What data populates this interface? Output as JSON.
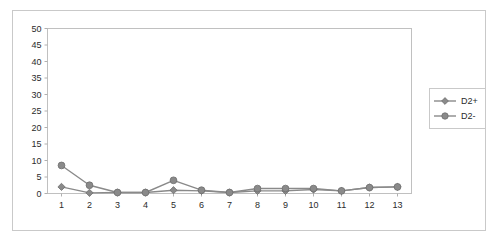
{
  "chart_data": {
    "type": "line",
    "title": "",
    "xlabel": "",
    "ylabel": "",
    "categories": [
      "1",
      "2",
      "3",
      "4",
      "5",
      "6",
      "7",
      "8",
      "9",
      "10",
      "11",
      "12",
      "13"
    ],
    "ylim": [
      0,
      50
    ],
    "yticks": [
      0,
      5,
      10,
      15,
      20,
      25,
      30,
      35,
      40,
      45,
      50
    ],
    "ytick_labels": [
      "0",
      "5",
      "10",
      "15",
      "20",
      "25",
      "30",
      "35",
      "40",
      "45",
      "50"
    ],
    "grid": false,
    "legend_position": "right",
    "series": [
      {
        "name": "D2+",
        "marker": "diamond",
        "color": "#8a8a8a",
        "values": [
          2.0,
          0.2,
          0.3,
          0.3,
          1.0,
          0.8,
          0.3,
          0.8,
          0.8,
          1.2,
          0.8,
          1.8,
          2.0
        ]
      },
      {
        "name": "D2-",
        "marker": "circle",
        "color": "#8a8a8a",
        "values": [
          8.5,
          2.5,
          0.3,
          0.3,
          4.0,
          1.0,
          0.3,
          1.5,
          1.5,
          1.5,
          0.8,
          1.8,
          2.0
        ]
      }
    ]
  },
  "legend": {
    "items": [
      {
        "label": "D2+"
      },
      {
        "label": "D2-"
      }
    ]
  },
  "colors": {
    "series": "#8a8a8a",
    "axis": "#b0b0b0",
    "frame": "#c9c9c9",
    "text": "#2b2b2b",
    "background": "#ffffff"
  }
}
